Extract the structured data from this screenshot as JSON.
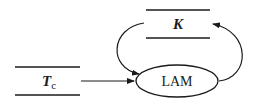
{
  "diagram": {
    "type": "data-flow",
    "nodes": [
      {
        "id": "tc",
        "kind": "data-store",
        "label": "T",
        "subscript": "c"
      },
      {
        "id": "k",
        "kind": "data-store",
        "label": "K"
      },
      {
        "id": "lam",
        "kind": "process",
        "label": "LAM"
      }
    ],
    "edges": [
      {
        "from": "tc",
        "to": "lam"
      },
      {
        "from": "k",
        "to": "lam"
      },
      {
        "from": "lam",
        "to": "k"
      }
    ],
    "colors": {
      "stroke": "#1a1a1a",
      "background": "#ffffff"
    }
  }
}
